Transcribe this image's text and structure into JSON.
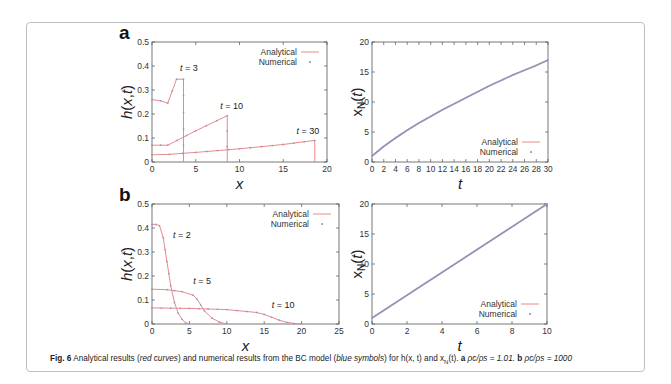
{
  "figure": {
    "panel_labels": [
      "a",
      "b"
    ],
    "caption": {
      "label": "Fig. 6",
      "text_1": "Analytical results (",
      "red_curves": "red curves",
      "text_2": ") and numerical results from the BC model (",
      "blue_symbols": "blue symbols",
      "text_3": ") for h(x, t) and x",
      "sub_N": "N",
      "text_4": "(t).",
      "a_label": "a",
      "a_text": "ρ",
      "a_eq": "ρc/ρs = 1.01.",
      "b_label": "b",
      "b_eq": "ρc/ρs = 1000"
    },
    "colors": {
      "analytical": "#e88a8a",
      "numerical": "#9a8fb8",
      "axis": "#555555",
      "frame": "#bfbfbf"
    }
  },
  "chart_data": [
    {
      "id": "a-left",
      "type": "line",
      "xlabel": "x",
      "ylabel": "h(x,t)",
      "xlim": [
        0,
        20
      ],
      "ylim": [
        0,
        0.5
      ],
      "xticks": [
        "0",
        "5",
        "10",
        "15",
        "20"
      ],
      "yticks": [
        "0",
        "0.1",
        "0.2",
        "0.3",
        "0.4",
        "0.5"
      ],
      "legend": [
        "Analytical",
        "Numerical"
      ],
      "annotations": [
        {
          "text": "t = 3",
          "x": 3.2,
          "y": 0.38
        },
        {
          "text": "t = 10",
          "x": 7.8,
          "y": 0.22
        },
        {
          "text": "t = 30",
          "x": 16.5,
          "y": 0.115
        }
      ],
      "series": [
        {
          "name": "t = 3",
          "x": [
            0,
            1,
            1.8,
            2.8,
            3.6,
            3.6
          ],
          "y": [
            0.26,
            0.255,
            0.245,
            0.345,
            0.345,
            0
          ]
        },
        {
          "name": "t = 10",
          "x": [
            0,
            1,
            1.8,
            5,
            8.6,
            8.6
          ],
          "y": [
            0.07,
            0.07,
            0.07,
            0.13,
            0.193,
            0
          ]
        },
        {
          "name": "t = 30",
          "x": [
            0,
            2,
            5,
            10,
            15,
            18.6,
            18.6
          ],
          "y": [
            0.03,
            0.032,
            0.04,
            0.055,
            0.073,
            0.09,
            0
          ]
        }
      ]
    },
    {
      "id": "a-right",
      "type": "line",
      "xlabel": "t",
      "ylabel": "x_N(t)",
      "xlim": [
        0,
        30
      ],
      "ylim": [
        0,
        20
      ],
      "xticks": [
        "0",
        "2",
        "4",
        "6",
        "8",
        "10",
        "12",
        "14",
        "16",
        "18",
        "20",
        "22",
        "24",
        "26",
        "28",
        "30"
      ],
      "yticks": [
        "0",
        "5",
        "10",
        "15",
        "20"
      ],
      "legend": [
        "Analytical",
        "Numerical"
      ],
      "series": [
        {
          "name": "x_N",
          "x": [
            0,
            2,
            4,
            6,
            8,
            10,
            12,
            14,
            16,
            18,
            20,
            22,
            24,
            26,
            28,
            30
          ],
          "y": [
            1.0,
            2.6,
            4.0,
            5.3,
            6.5,
            7.6,
            8.7,
            9.7,
            10.7,
            11.7,
            12.7,
            13.6,
            14.5,
            15.3,
            16.1,
            17.0
          ]
        }
      ]
    },
    {
      "id": "b-left",
      "type": "line",
      "xlabel": "x",
      "ylabel": "h(x,t)",
      "xlim": [
        0,
        25
      ],
      "ylim": [
        0,
        0.5
      ],
      "xticks": [
        "0",
        "5",
        "10",
        "15",
        "20",
        "25"
      ],
      "yticks": [
        "0",
        "0.1",
        "0.2",
        "0.3",
        "0.4",
        "0.5"
      ],
      "legend": [
        "Analytical",
        "Numerical"
      ],
      "annotations": [
        {
          "text": "t = 2",
          "x": 2.8,
          "y": 0.36
        },
        {
          "text": "t = 5",
          "x": 5.5,
          "y": 0.165
        },
        {
          "text": "t = 10",
          "x": 16,
          "y": 0.065
        }
      ],
      "series": [
        {
          "name": "t = 2",
          "x": [
            0,
            0.5,
            1,
            1.5,
            2,
            2.5,
            3,
            3.5,
            4,
            4.5,
            5
          ],
          "y": [
            0.415,
            0.415,
            0.41,
            0.36,
            0.26,
            0.16,
            0.09,
            0.045,
            0.02,
            0.005,
            0
          ]
        },
        {
          "name": "t = 5",
          "x": [
            0,
            2,
            4,
            5.5,
            6,
            6.5,
            7,
            8,
            9,
            10
          ],
          "y": [
            0.145,
            0.143,
            0.135,
            0.12,
            0.105,
            0.08,
            0.055,
            0.025,
            0.008,
            0
          ]
        },
        {
          "name": "t = 10",
          "x": [
            0,
            5,
            10,
            14,
            15,
            16,
            17,
            18,
            19,
            20
          ],
          "y": [
            0.067,
            0.065,
            0.06,
            0.048,
            0.04,
            0.028,
            0.016,
            0.007,
            0.002,
            0
          ]
        }
      ]
    },
    {
      "id": "b-right",
      "type": "line",
      "xlabel": "t",
      "ylabel": "x_N(t)",
      "xlim": [
        0,
        10
      ],
      "ylim": [
        0,
        20
      ],
      "xticks": [
        "0",
        "2",
        "4",
        "6",
        "8",
        "10"
      ],
      "yticks": [
        "0",
        "5",
        "10",
        "15",
        "20"
      ],
      "legend": [
        "Analytical",
        "Numerical"
      ],
      "series": [
        {
          "name": "x_N",
          "x": [
            0,
            10
          ],
          "y": [
            1,
            20
          ]
        }
      ]
    }
  ]
}
